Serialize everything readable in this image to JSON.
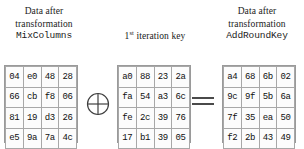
{
  "figure": {
    "type": "aes-addroundkey-diagram",
    "background_color": "#ffffff",
    "text_color": "#1a1a1a",
    "grid_border_color": "#a8a8a8"
  },
  "captions": {
    "left": {
      "line1": "Data after",
      "line2": "transformation",
      "line3_mono": "MixColumns"
    },
    "middle": {
      "number": "1",
      "ordinal_suffix": "st",
      "rest": " iteration key"
    },
    "right": {
      "line1": "Data after",
      "line2": "transformation",
      "line3_mono": "AddRoundKey"
    }
  },
  "operators": {
    "xor": "circled-plus",
    "equals": "equals-sign"
  },
  "matrices": {
    "left": {
      "label": "MixColumns output state",
      "rows": [
        [
          "04",
          "e0",
          "48",
          "28"
        ],
        [
          "66",
          "cb",
          "f8",
          "06"
        ],
        [
          "81",
          "19",
          "d3",
          "26"
        ],
        [
          "e5",
          "9a",
          "7a",
          "4c"
        ]
      ]
    },
    "middle": {
      "label": "first iteration round key",
      "rows": [
        [
          "a0",
          "88",
          "23",
          "2a"
        ],
        [
          "fa",
          "54",
          "a3",
          "6c"
        ],
        [
          "fe",
          "2c",
          "39",
          "76"
        ],
        [
          "17",
          "b1",
          "39",
          "05"
        ]
      ]
    },
    "right": {
      "label": "AddRoundKey output state",
      "rows": [
        [
          "a4",
          "68",
          "6b",
          "02"
        ],
        [
          "9c",
          "9f",
          "5b",
          "6a"
        ],
        [
          "7f",
          "35",
          "ea",
          "50"
        ],
        [
          "f2",
          "2b",
          "43",
          "49"
        ]
      ]
    }
  }
}
